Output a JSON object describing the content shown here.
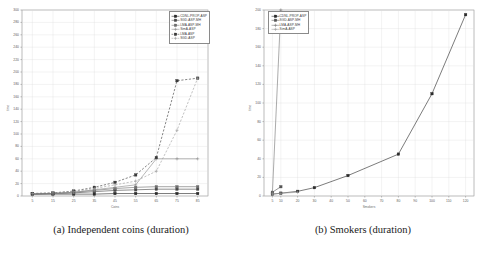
{
  "figure": {
    "panels": [
      {
        "caption": "(a) Independent coins (duration)",
        "ylabel": "time",
        "xlabel": "Coins"
      },
      {
        "caption": "(b) Smokers (duration)",
        "ylabel": "time",
        "xlabel": "Smokers"
      }
    ]
  },
  "chart_data": [
    {
      "type": "line",
      "title": "(a) Independent coins (duration)",
      "xlabel": "Coins",
      "ylabel": "time",
      "xlim": [
        0,
        90
      ],
      "ylim": [
        0,
        300
      ],
      "xticks": [
        5,
        15,
        25,
        35,
        45,
        55,
        65,
        75,
        85
      ],
      "yticks": [
        0,
        20,
        40,
        60,
        80,
        100,
        120,
        140,
        160,
        180,
        200,
        220,
        240,
        260,
        280,
        300
      ],
      "grid": true,
      "legend_position": "top-right",
      "x": [
        5,
        15,
        25,
        35,
        45,
        55,
        65,
        75,
        85
      ],
      "series": [
        {
          "name": "CDNL-PROP-ASP",
          "style": "solid",
          "marker": "square",
          "color": "#2b2b2b",
          "values": [
            3,
            3,
            3,
            3,
            4,
            4,
            4,
            4,
            4
          ]
        },
        {
          "name": "SGD-ASP-MH",
          "style": "solid",
          "marker": "square",
          "color": "#4a4a4a",
          "values": [
            3,
            4,
            5,
            7,
            9,
            10,
            11,
            11,
            11
          ]
        },
        {
          "name": "LMA-ASP-MH",
          "style": "solid",
          "marker": "square",
          "color": "#6e6e6e",
          "values": [
            3,
            4,
            6,
            9,
            12,
            14,
            15,
            15,
            15
          ]
        },
        {
          "name": "SimA-ASP",
          "style": "solid",
          "marker": "plus",
          "color": "#8a8a8a",
          "values": [
            3,
            4,
            6,
            10,
            14,
            18,
            60,
            60,
            60
          ]
        },
        {
          "name": "LMA-ASP",
          "style": "dashed",
          "marker": "square",
          "color": "#3a3a3a",
          "values": [
            4,
            5,
            8,
            14,
            22,
            34,
            62,
            186,
            190
          ]
        },
        {
          "name": "SGD-ASP",
          "style": "dashed",
          "marker": "plus",
          "color": "#9a9a9a",
          "values": [
            4,
            5,
            7,
            12,
            18,
            24,
            40,
            106,
            190
          ]
        }
      ]
    },
    {
      "type": "line",
      "title": "(b) Smokers (duration)",
      "xlabel": "Smokers",
      "ylabel": "time",
      "xlim": [
        0,
        125
      ],
      "ylim": [
        0,
        200
      ],
      "xticks": [
        5,
        10,
        20,
        30,
        40,
        50,
        60,
        70,
        80,
        90,
        100,
        110,
        120
      ],
      "yticks": [
        0,
        20,
        40,
        60,
        80,
        100,
        120,
        140,
        160,
        180,
        200
      ],
      "grid": true,
      "legend_position": "top-left",
      "x": [
        5,
        10,
        20,
        30,
        50,
        80,
        100,
        120
      ],
      "series": [
        {
          "name": "CDNL-PROP-ASP",
          "style": "solid",
          "marker": "square",
          "color": "#2b2b2b",
          "values": [
            2,
            3,
            5,
            9,
            22,
            45,
            110,
            195
          ]
        },
        {
          "name": "SGD-ASP-MH",
          "style": "solid",
          "marker": "square",
          "color": "#555555",
          "values": [
            4,
            10,
            null,
            null,
            null,
            null,
            null,
            null
          ]
        },
        {
          "name": "LMA-ASP-MH",
          "style": "solid",
          "marker": "plus",
          "color": "#777777",
          "values": [
            3,
            200,
            null,
            null,
            null,
            null,
            null,
            null
          ]
        },
        {
          "name": "SimA-ASP",
          "style": "solid",
          "marker": "plus",
          "color": "#9a9a9a",
          "values": [
            2,
            3,
            4,
            null,
            null,
            null,
            null,
            null
          ]
        }
      ]
    }
  ]
}
